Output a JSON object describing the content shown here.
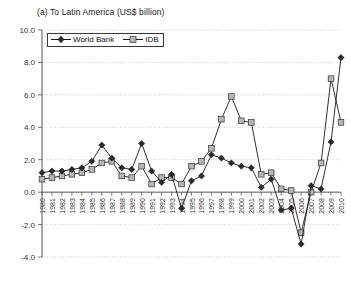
{
  "chart_data": {
    "type": "line",
    "title": "(a) To Latin America (US$ billion)",
    "xlabel": "",
    "ylabel": "",
    "ylim": [
      -4.0,
      10.0
    ],
    "ytick_labels": [
      "10.0",
      "8.0",
      "6.0",
      "4.0",
      "2.0",
      "0.0",
      "-2.0",
      "-4.0"
    ],
    "ytick_values": [
      10.0,
      8.0,
      6.0,
      4.0,
      2.0,
      0.0,
      -2.0,
      -4.0
    ],
    "grid": true,
    "legend_position": "top-left",
    "categories": [
      "1980",
      "1981",
      "1982",
      "1983",
      "1984",
      "1985",
      "1986",
      "1987",
      "1988",
      "1989",
      "1990",
      "1991",
      "1992",
      "1993",
      "1994",
      "1995",
      "1996",
      "1997",
      "1998",
      "1999",
      "2000",
      "2001",
      "2002",
      "2003",
      "2004",
      "2005",
      "2006",
      "2007",
      "2008",
      "2009",
      "2010"
    ],
    "series": [
      {
        "name": "World Bank",
        "marker": "diamond",
        "color": "#2b2b2b",
        "values": [
          1.2,
          1.3,
          1.3,
          1.4,
          1.5,
          1.9,
          2.9,
          2.1,
          1.5,
          1.4,
          3.0,
          1.3,
          0.6,
          1.1,
          -1.0,
          0.7,
          1.0,
          2.3,
          2.1,
          1.8,
          1.6,
          1.5,
          0.3,
          0.8,
          -1.1,
          -1.0,
          -3.2,
          0.4,
          0.2,
          3.1,
          8.3
        ]
      },
      {
        "name": "IDB",
        "marker": "square",
        "color": "#b6b6b6",
        "values": [
          0.8,
          0.9,
          1.0,
          1.1,
          1.2,
          1.4,
          1.8,
          1.9,
          1.0,
          0.9,
          1.6,
          0.5,
          0.9,
          0.9,
          0.5,
          1.6,
          1.9,
          2.7,
          4.5,
          5.9,
          4.4,
          4.3,
          1.1,
          1.2,
          0.2,
          0.1,
          -2.5,
          0.0,
          1.8,
          7.0,
          4.3
        ]
      }
    ]
  },
  "legend": {
    "items": [
      {
        "label": "World Bank",
        "marker": "diamond"
      },
      {
        "label": "IDB",
        "marker": "square"
      }
    ]
  }
}
